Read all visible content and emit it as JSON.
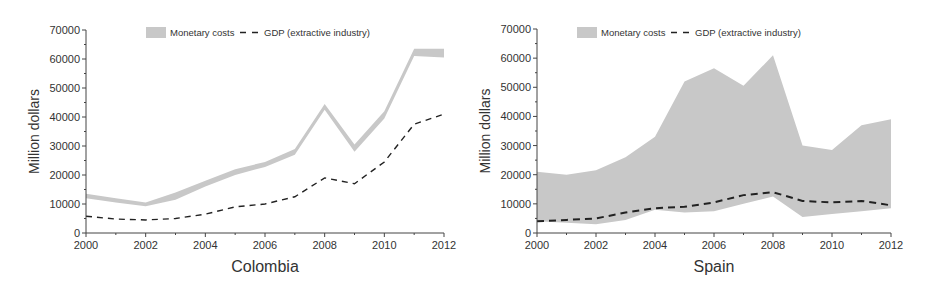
{
  "colors": {
    "band": "#c8c8c8",
    "gdp_line": "#222222",
    "axis": "#444444",
    "text": "#333333"
  },
  "legend": {
    "band_label": "Monetary costs",
    "line_label": "GDP (extractive industry)"
  },
  "charts": [
    {
      "id": "colombia",
      "title": "Colombia",
      "ylabel": "Million dollars"
    },
    {
      "id": "spain",
      "title": "Spain",
      "ylabel": "Million dollars"
    }
  ],
  "chart_data": [
    {
      "type": "area",
      "title": "Colombia",
      "xlabel": "Colombia",
      "ylabel": "Million dollars",
      "xlim": [
        2000,
        2012
      ],
      "ylim": [
        0,
        70000
      ],
      "x_ticks": [
        2000,
        2002,
        2004,
        2006,
        2008,
        2010,
        2012
      ],
      "y_ticks": [
        0,
        10000,
        20000,
        30000,
        40000,
        50000,
        60000,
        70000
      ],
      "grid": false,
      "legend_position": "top-center",
      "x": [
        2000,
        2001,
        2002,
        2003,
        2004,
        2005,
        2006,
        2007,
        2008,
        2009,
        2010,
        2011,
        2012
      ],
      "series": [
        {
          "name": "Monetary costs",
          "kind": "band",
          "upper": [
            13500,
            12000,
            10500,
            14000,
            18000,
            22000,
            24500,
            29000,
            44500,
            30500,
            42000,
            63500,
            63500
          ],
          "lower": [
            12000,
            10500,
            9200,
            11500,
            16000,
            20000,
            22800,
            27000,
            42500,
            28000,
            39500,
            61000,
            60500
          ]
        },
        {
          "name": "GDP (extractive industry)",
          "kind": "dashed-line",
          "values": [
            5800,
            4800,
            4500,
            5000,
            6500,
            9000,
            10000,
            12500,
            19000,
            17000,
            24500,
            37500,
            41000
          ]
        }
      ]
    },
    {
      "type": "area",
      "title": "Spain",
      "xlabel": "Spain",
      "ylabel": "Million dollars",
      "xlim": [
        2000,
        2012
      ],
      "ylim": [
        0,
        70000
      ],
      "x_ticks": [
        2000,
        2002,
        2004,
        2006,
        2008,
        2010,
        2012
      ],
      "y_ticks": [
        0,
        10000,
        20000,
        30000,
        40000,
        50000,
        60000,
        70000
      ],
      "grid": false,
      "legend_position": "top-center",
      "x": [
        2000,
        2001,
        2002,
        2003,
        2004,
        2005,
        2006,
        2007,
        2008,
        2009,
        2010,
        2011,
        2012
      ],
      "series": [
        {
          "name": "Monetary costs",
          "kind": "band",
          "upper": [
            21000,
            20000,
            21500,
            26000,
            33000,
            52000,
            56500,
            50500,
            61000,
            30000,
            28500,
            37000,
            39000
          ],
          "lower": [
            4000,
            3500,
            3000,
            4500,
            8000,
            7000,
            7500,
            10000,
            12500,
            5500,
            6500,
            7500,
            8500
          ]
        },
        {
          "name": "GDP (extractive industry)",
          "kind": "dashed-line",
          "values": [
            4000,
            4500,
            5000,
            7000,
            8500,
            9000,
            10500,
            13000,
            14000,
            11000,
            10500,
            11000,
            9500
          ]
        }
      ]
    }
  ]
}
